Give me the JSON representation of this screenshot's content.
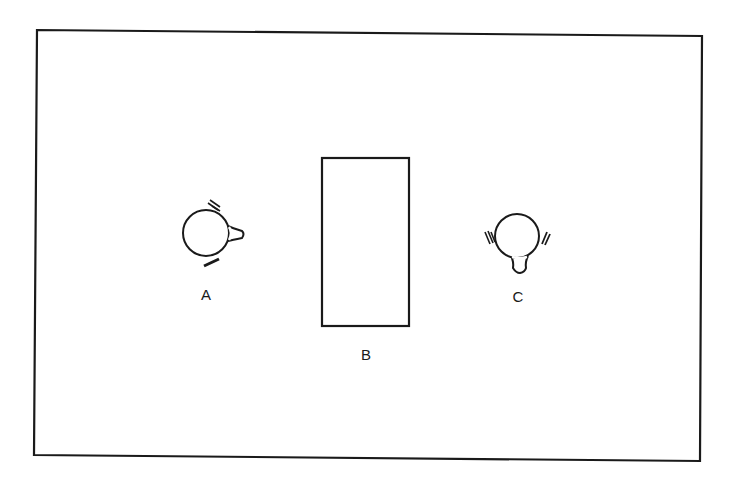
{
  "diagram": {
    "type": "top-down scene sketch",
    "stroke_color": "#1a1a1a",
    "background_color": "#ffffff",
    "frame": {
      "description": "outer rectangular border"
    },
    "objects": [
      {
        "id": "A",
        "label": "A",
        "kind": "person-top-view",
        "facing": "right"
      },
      {
        "id": "B",
        "label": "B",
        "kind": "rectangle-object"
      },
      {
        "id": "C",
        "label": "C",
        "kind": "person-top-view",
        "facing": "down"
      }
    ]
  }
}
